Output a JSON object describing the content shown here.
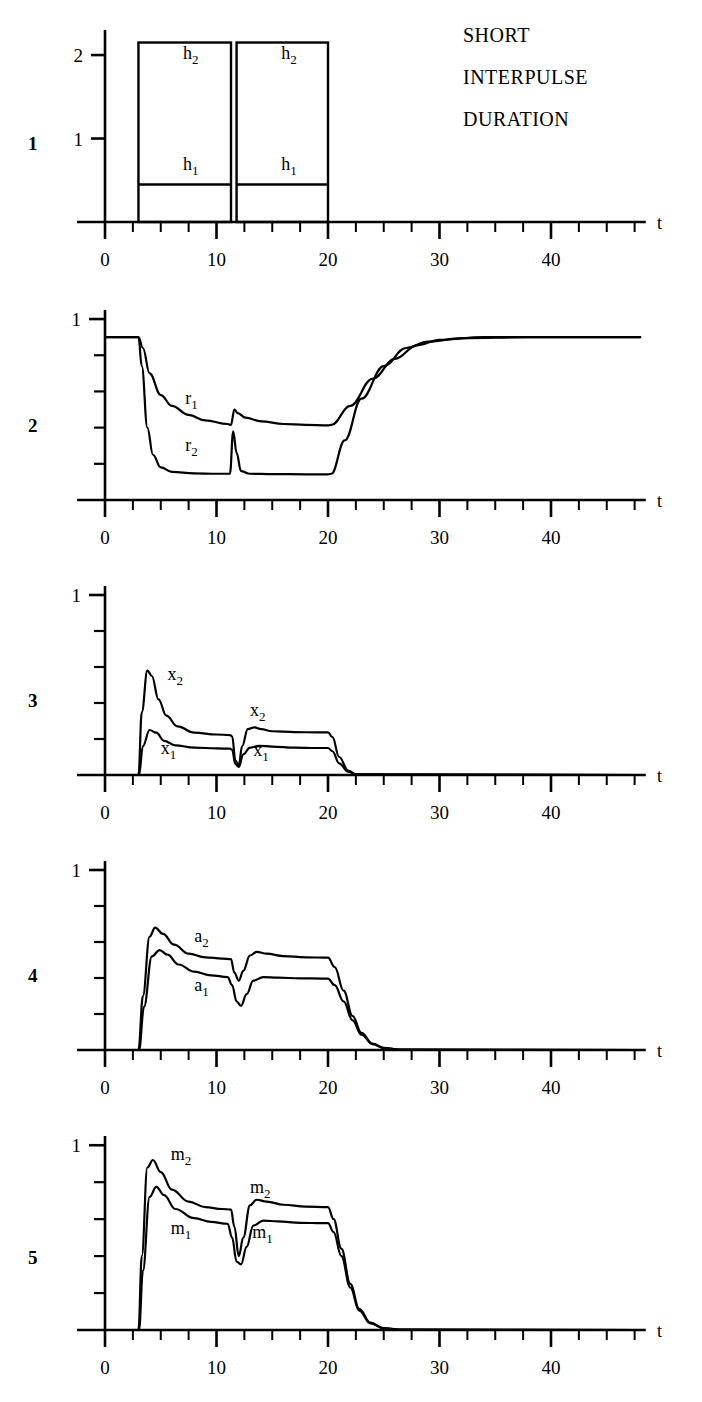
{
  "figure": {
    "title_lines": [
      "SHORT",
      "INTERPULSE",
      "DURATION"
    ],
    "axis_label_t": "t",
    "x_tick_labels": [
      "0",
      "10",
      "20",
      "30",
      "40"
    ],
    "x_tick_values": [
      0,
      10,
      20,
      30,
      40
    ],
    "x_minor_step": 2.5,
    "x_range": [
      0,
      48
    ]
  },
  "panels": [
    {
      "number": "1",
      "y_tick_labels": [
        "1",
        "2"
      ],
      "y_tick_values": [
        1,
        2
      ],
      "y_range": [
        0,
        2.3
      ],
      "curve_labels": [
        {
          "base": "h",
          "sub": "2",
          "x": 7.0,
          "y": 1.95
        },
        {
          "base": "h",
          "sub": "2",
          "x": 15.8,
          "y": 1.95
        },
        {
          "base": "h",
          "sub": "1",
          "x": 7.0,
          "y": 0.62
        },
        {
          "base": "h",
          "sub": "1",
          "x": 15.8,
          "y": 0.62
        }
      ]
    },
    {
      "number": "2",
      "y_tick_labels": [
        "1"
      ],
      "y_tick_values": [
        1
      ],
      "y_range": [
        0,
        1.05
      ],
      "curve_labels": [
        {
          "base": "r",
          "sub": "1",
          "x": 7.2,
          "y": 0.53
        },
        {
          "base": "r",
          "sub": "2",
          "x": 7.2,
          "y": 0.27
        }
      ]
    },
    {
      "number": "3",
      "y_tick_labels": [
        "1"
      ],
      "y_tick_values": [
        1
      ],
      "y_range": [
        0,
        1.05
      ],
      "curve_labels": [
        {
          "base": "x",
          "sub": "2",
          "x": 5.6,
          "y": 0.53
        },
        {
          "base": "x",
          "sub": "1",
          "x": 5.0,
          "y": 0.115
        },
        {
          "base": "x",
          "sub": "2",
          "x": 13.0,
          "y": 0.33
        },
        {
          "base": "x",
          "sub": "1",
          "x": 13.3,
          "y": 0.105
        }
      ]
    },
    {
      "number": "4",
      "y_tick_labels": [
        "1"
      ],
      "y_tick_values": [
        1
      ],
      "y_range": [
        0,
        1.05
      ],
      "curve_labels": [
        {
          "base": "a",
          "sub": "2",
          "x": 8.0,
          "y": 0.6
        },
        {
          "base": "a",
          "sub": "1",
          "x": 8.0,
          "y": 0.33
        }
      ]
    },
    {
      "number": "5",
      "y_tick_labels": [
        "1"
      ],
      "y_tick_values": [
        1
      ],
      "y_range": [
        0,
        1.05
      ],
      "curve_labels": [
        {
          "base": "m",
          "sub": "2",
          "x": 5.9,
          "y": 0.92
        },
        {
          "base": "m",
          "sub": "1",
          "x": 5.9,
          "y": 0.52
        },
        {
          "base": "m",
          "sub": "2",
          "x": 13.0,
          "y": 0.74
        },
        {
          "base": "m",
          "sub": "1",
          "x": 13.2,
          "y": 0.5
        }
      ]
    }
  ],
  "chart_data": [
    {
      "type": "line",
      "panel": "1",
      "title": "SHORT INTERPULSE DURATION",
      "xlabel": "t",
      "ylabel": "",
      "xlim": [
        0,
        48
      ],
      "ylim": [
        0,
        2.3
      ],
      "grid": false,
      "legend": "inline-annotations",
      "description": "Two rectangular stimulus pulses, each split into a lower band h1 and an upper band h2.",
      "pulses": [
        {
          "t_start": 3.0,
          "t_end": 11.3,
          "h1_top": 0.45,
          "h2_top": 2.15
        },
        {
          "t_start": 11.8,
          "t_end": 20.0,
          "h1_top": 0.45,
          "h2_top": 2.15
        }
      ],
      "series": [
        {
          "name": "h1",
          "values": [
            0.45,
            0.45
          ]
        },
        {
          "name": "h2",
          "values": [
            2.15,
            2.15
          ]
        }
      ]
    },
    {
      "type": "line",
      "panel": "2",
      "xlabel": "t",
      "ylabel": "",
      "xlim": [
        0,
        48
      ],
      "ylim": [
        0,
        1.05
      ],
      "grid": false,
      "description": "Resource variables r1 and r2 deplete during the pulses and recover after t=20.",
      "series": [
        {
          "name": "r1",
          "x": [
            0,
            3.0,
            3.4,
            4.0,
            5.0,
            6.0,
            7.5,
            9.0,
            11.0,
            11.3,
            11.6,
            11.9,
            12.6,
            14,
            16,
            18,
            20,
            20.3,
            22,
            24,
            26,
            28,
            30,
            34,
            40,
            48
          ],
          "y": [
            0.9,
            0.9,
            0.84,
            0.7,
            0.58,
            0.52,
            0.47,
            0.44,
            0.42,
            0.415,
            0.5,
            0.48,
            0.455,
            0.435,
            0.42,
            0.415,
            0.412,
            0.415,
            0.52,
            0.67,
            0.78,
            0.855,
            0.885,
            0.9,
            0.9,
            0.9
          ]
        },
        {
          "name": "r2",
          "x": [
            0,
            3.0,
            3.3,
            3.8,
            4.3,
            5.0,
            6.0,
            8.0,
            10.0,
            11.2,
            11.5,
            11.8,
            12.2,
            13.0,
            15,
            18,
            20,
            20.3,
            21.5,
            23,
            25,
            27,
            29,
            32,
            38,
            48
          ],
          "y": [
            0.9,
            0.9,
            0.74,
            0.4,
            0.25,
            0.18,
            0.155,
            0.147,
            0.145,
            0.145,
            0.38,
            0.26,
            0.16,
            0.145,
            0.143,
            0.142,
            0.142,
            0.145,
            0.33,
            0.56,
            0.74,
            0.84,
            0.875,
            0.895,
            0.9,
            0.9
          ]
        }
      ]
    },
    {
      "type": "line",
      "panel": "3",
      "xlabel": "t",
      "ylabel": "",
      "xlim": [
        0,
        48
      ],
      "ylim": [
        0,
        1.05
      ],
      "grid": false,
      "description": "Synaptic drive x1 and x2 showing sharp onset transients and a deep notch at the interpulse gap.",
      "series": [
        {
          "name": "x2",
          "x": [
            0,
            3.0,
            3.3,
            3.8,
            4.2,
            4.8,
            5.5,
            6.5,
            8.0,
            10.0,
            11.2,
            11.4,
            11.7,
            12.0,
            12.3,
            12.8,
            13.4,
            14.0,
            15.0,
            17.0,
            19.0,
            20.0,
            20.4,
            21.0,
            21.8,
            22.5,
            48
          ],
          "y": [
            0.0,
            0.0,
            0.35,
            0.58,
            0.55,
            0.42,
            0.33,
            0.27,
            0.235,
            0.225,
            0.222,
            0.215,
            0.08,
            0.055,
            0.16,
            0.255,
            0.265,
            0.255,
            0.243,
            0.238,
            0.237,
            0.237,
            0.21,
            0.1,
            0.025,
            0.004,
            0.0
          ]
        },
        {
          "name": "x1",
          "x": [
            0,
            3.05,
            3.4,
            4.0,
            4.6,
            5.3,
            6.3,
            8.0,
            10.0,
            11.2,
            11.4,
            11.7,
            12.0,
            12.4,
            13.0,
            13.8,
            15.0,
            17.0,
            19.0,
            20.0,
            20.4,
            21.0,
            21.8,
            22.5,
            48
          ],
          "y": [
            0.0,
            0.0,
            0.16,
            0.25,
            0.235,
            0.19,
            0.165,
            0.152,
            0.148,
            0.146,
            0.14,
            0.06,
            0.045,
            0.115,
            0.152,
            0.162,
            0.158,
            0.152,
            0.15,
            0.15,
            0.132,
            0.065,
            0.018,
            0.003,
            0.0
          ]
        }
      ]
    },
    {
      "type": "line",
      "panel": "4",
      "xlabel": "t",
      "ylabel": "",
      "xlim": [
        0,
        48
      ],
      "ylim": [
        0,
        1.05
      ],
      "grid": false,
      "description": "Activity variables a1 and a2 with smooth rises, a notch at the gap, and a slow decay after t=20.",
      "series": [
        {
          "name": "a2",
          "x": [
            0,
            3.0,
            3.4,
            4.0,
            4.5,
            5.2,
            6.2,
            7.5,
            9.0,
            10.5,
            11.3,
            11.6,
            12.0,
            12.4,
            13.0,
            13.6,
            14.5,
            16,
            18,
            20,
            20.6,
            21.4,
            22.2,
            23.0,
            24.0,
            25.0,
            26.5,
            48
          ],
          "y": [
            0.0,
            0.0,
            0.3,
            0.63,
            0.68,
            0.645,
            0.585,
            0.535,
            0.515,
            0.508,
            0.505,
            0.43,
            0.385,
            0.44,
            0.525,
            0.545,
            0.535,
            0.522,
            0.515,
            0.513,
            0.46,
            0.33,
            0.19,
            0.095,
            0.035,
            0.012,
            0.002,
            0.0
          ]
        },
        {
          "name": "a1",
          "x": [
            0,
            3.05,
            3.5,
            4.2,
            4.9,
            5.6,
            6.6,
            8.0,
            9.5,
            11.0,
            11.4,
            11.8,
            12.2,
            12.7,
            13.3,
            14.2,
            15.5,
            17.5,
            19.5,
            20.0,
            20.6,
            21.4,
            22.2,
            23.0,
            24.0,
            25.0,
            26.5,
            48
          ],
          "y": [
            0.0,
            0.0,
            0.24,
            0.52,
            0.555,
            0.53,
            0.475,
            0.435,
            0.415,
            0.405,
            0.36,
            0.27,
            0.245,
            0.31,
            0.385,
            0.405,
            0.402,
            0.398,
            0.397,
            0.397,
            0.36,
            0.27,
            0.165,
            0.085,
            0.032,
            0.011,
            0.002,
            0.0
          ]
        }
      ]
    },
    {
      "type": "line",
      "panel": "5",
      "xlabel": "t",
      "ylabel": "",
      "xlim": [
        0,
        48
      ],
      "ylim": [
        0,
        1.05
      ],
      "grid": false,
      "description": "Motor output m1 and m2; m2 peaks near 0.92 at onset, both fall to zero by about t=25.",
      "series": [
        {
          "name": "m2",
          "x": [
            0,
            3.0,
            3.3,
            3.8,
            4.3,
            5.0,
            6.0,
            7.5,
            9.0,
            10.5,
            11.3,
            11.6,
            12.0,
            12.4,
            13.0,
            13.6,
            14.5,
            16,
            18,
            20,
            20.5,
            21.2,
            22.0,
            22.8,
            23.8,
            25.0,
            26.5,
            48
          ],
          "y": [
            0.0,
            0.0,
            0.4,
            0.88,
            0.92,
            0.855,
            0.76,
            0.695,
            0.665,
            0.655,
            0.652,
            0.56,
            0.4,
            0.5,
            0.675,
            0.705,
            0.695,
            0.678,
            0.668,
            0.665,
            0.6,
            0.44,
            0.25,
            0.115,
            0.04,
            0.01,
            0.002,
            0.0
          ]
        },
        {
          "name": "m1",
          "x": [
            0,
            3.05,
            3.4,
            4.0,
            4.6,
            5.3,
            6.3,
            8.0,
            9.5,
            11.0,
            11.4,
            11.8,
            12.2,
            12.7,
            13.3,
            14.2,
            15.5,
            17.5,
            19.5,
            20.0,
            20.5,
            21.2,
            22.0,
            22.8,
            23.8,
            25.0,
            26.5,
            48
          ],
          "y": [
            0.0,
            0.0,
            0.32,
            0.72,
            0.775,
            0.73,
            0.655,
            0.605,
            0.585,
            0.575,
            0.5,
            0.37,
            0.355,
            0.45,
            0.565,
            0.592,
            0.588,
            0.58,
            0.578,
            0.578,
            0.53,
            0.4,
            0.23,
            0.105,
            0.036,
            0.009,
            0.002,
            0.0
          ]
        }
      ]
    }
  ]
}
